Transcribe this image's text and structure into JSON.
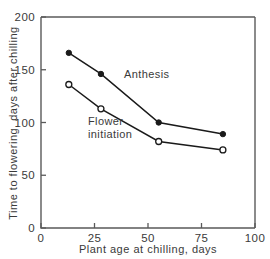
{
  "chart_data": {
    "type": "line",
    "title": "",
    "xlabel": "Plant age at chilling, days",
    "ylabel": "Time to flowering, days after chilling",
    "xlim": [
      0,
      100
    ],
    "ylim": [
      0,
      200
    ],
    "xticks": [
      0,
      25,
      50,
      75,
      100
    ],
    "yticks": [
      0,
      50,
      100,
      150,
      200
    ],
    "xticklabels": [
      "0",
      "25",
      "50",
      "75",
      "100"
    ],
    "yticklabels": [
      "0",
      "50",
      "100",
      "150",
      "200"
    ],
    "grid": false,
    "legend_position": "inline-annotations",
    "series": [
      {
        "name": "Anthesis",
        "marker": "filled-circle",
        "color": "#1a1a1a",
        "x": [
          13,
          28,
          55,
          85
        ],
        "values": [
          166,
          146,
          100,
          89
        ]
      },
      {
        "name": "Flower initiation",
        "marker": "open-circle",
        "color": "#1a1a1a",
        "x": [
          13,
          28,
          55,
          85
        ],
        "values": [
          136,
          113,
          82,
          74
        ]
      }
    ],
    "annotations": [
      {
        "text": "Anthesis",
        "x_px": 124,
        "y_px": 78
      },
      {
        "text": "Flower",
        "x_px": 88,
        "y_px": 125
      },
      {
        "text": "initiation",
        "x_px": 88,
        "y_px": 138
      }
    ]
  }
}
